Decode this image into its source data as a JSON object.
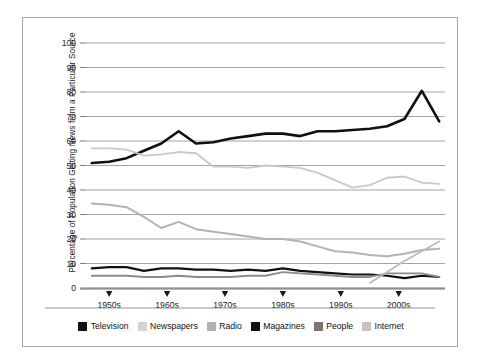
{
  "chart_data": {
    "type": "line",
    "title": "",
    "xlabel": "",
    "ylabel": "Percentage of Population Getting News from a Particular Source",
    "ylim": [
      0,
      100
    ],
    "ytick_labels": [
      "0",
      "10",
      "20",
      "30",
      "40",
      "50",
      "60",
      "70",
      "80",
      "90",
      "100"
    ],
    "ytick_values": [
      0,
      10,
      20,
      30,
      40,
      50,
      60,
      70,
      80,
      90,
      100
    ],
    "xtick_labels": [
      "1950s",
      "1960s",
      "1970s",
      "1980s",
      "1990s",
      "2000s"
    ],
    "xtick_values": [
      1950,
      1960,
      1970,
      1980,
      1990,
      2000
    ],
    "xlim": [
      1946,
      2008
    ],
    "grid": true,
    "legend_position": "bottom",
    "series": [
      {
        "name": "Television",
        "color": "#101010",
        "width": 2.6,
        "x": [
          1947,
          1950,
          1953,
          1956,
          1959,
          1962,
          1965,
          1968,
          1971,
          1974,
          1977,
          1980,
          1983,
          1986,
          1989,
          1992,
          1995,
          1998,
          2001,
          2004,
          2007
        ],
        "values": [
          51,
          51.5,
          53,
          56,
          59,
          64,
          59,
          59.5,
          61,
          62,
          63,
          63,
          62,
          64,
          64,
          64.5,
          65,
          66,
          69,
          80.5,
          68
        ]
      },
      {
        "name": "Newspapers",
        "color": "#c9c9c9",
        "width": 1.8,
        "x": [
          1947,
          1950,
          1953,
          1956,
          1959,
          1962,
          1965,
          1968,
          1971,
          1974,
          1977,
          1980,
          1983,
          1986,
          1989,
          1992,
          1995,
          1998,
          2001,
          2004,
          2007
        ],
        "values": [
          57,
          57,
          56.5,
          54,
          54.5,
          55.5,
          55,
          49.5,
          49.5,
          49,
          50,
          49.5,
          49,
          47,
          44,
          41,
          42,
          45,
          45.5,
          43,
          42.5
        ]
      },
      {
        "name": "Radio",
        "color": "#b3b3b3",
        "width": 2.0,
        "x": [
          1947,
          1950,
          1953,
          1956,
          1959,
          1962,
          1965,
          1968,
          1971,
          1974,
          1977,
          1980,
          1983,
          1986,
          1989,
          1992,
          1995,
          1998,
          2001,
          2004,
          2007
        ],
        "values": [
          34.5,
          34,
          33,
          29,
          24.5,
          27,
          24,
          23,
          22,
          21,
          20,
          20,
          19,
          17,
          15,
          14.5,
          13.5,
          13,
          14,
          15.5,
          16
        ]
      },
      {
        "name": "Magazines",
        "color": "#101010",
        "width": 2.2,
        "x": [
          1947,
          1950,
          1953,
          1956,
          1959,
          1962,
          1965,
          1968,
          1971,
          1974,
          1977,
          1980,
          1983,
          1986,
          1989,
          1992,
          1995,
          1998,
          2001,
          2004,
          2007
        ],
        "values": [
          8,
          8.5,
          8.5,
          7,
          8,
          8,
          7.5,
          7.5,
          7,
          7.5,
          7,
          8,
          7,
          6.5,
          6,
          5.5,
          5.5,
          5,
          4,
          5,
          4.5
        ]
      },
      {
        "name": "People",
        "color": "#8c8c8c",
        "width": 1.8,
        "x": [
          1947,
          1950,
          1953,
          1956,
          1959,
          1962,
          1965,
          1968,
          1971,
          1974,
          1977,
          1980,
          1983,
          1986,
          1989,
          1992,
          1995,
          1998,
          2001,
          2004,
          2007
        ],
        "values": [
          5,
          5,
          5,
          4.5,
          4.5,
          5,
          4.5,
          4.5,
          4.5,
          5,
          5,
          6.5,
          6,
          5.5,
          5,
          4.5,
          4.5,
          6,
          6,
          6,
          4.5
        ]
      },
      {
        "name": "Internet",
        "color": "#bcbcbc",
        "width": 1.8,
        "x": [
          1995,
          1998,
          2001,
          2004,
          2007
        ],
        "values": [
          2,
          6.5,
          11,
          15,
          19
        ]
      }
    ]
  },
  "legend": {
    "items": [
      {
        "label": "Television",
        "color": "#101010"
      },
      {
        "label": "Newspapers",
        "color": "#d2d2d2"
      },
      {
        "label": "Radio",
        "color": "#b3b3b3"
      },
      {
        "label": "Magazines",
        "color": "#101010"
      },
      {
        "label": "People",
        "color": "#777777"
      },
      {
        "label": "Internet",
        "color": "#c4c4c4"
      }
    ]
  },
  "axes": {
    "y_axis_title": "Percentage of Population Getting News from a Particular Source"
  }
}
